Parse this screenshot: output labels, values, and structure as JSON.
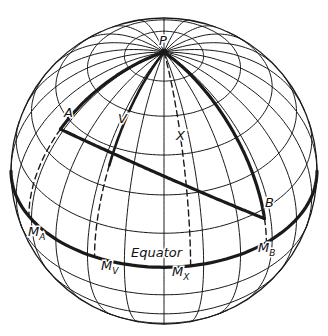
{
  "figure": {
    "type": "orthographic globe diagram",
    "center": [
      164,
      171
    ],
    "radius": 153,
    "view_elevation_deg": 39,
    "meridian_step_deg": 15,
    "parallel_step_deg": 15,
    "colors": {
      "line": "#1a1a1a",
      "background": "#ffffff"
    }
  },
  "labels": {
    "pole": "P",
    "point_a": "A",
    "point_b": "B",
    "point_v": "V",
    "point_x": "X",
    "equator": "Equator",
    "m_a": {
      "base": "M",
      "sub": "A"
    },
    "m_v": {
      "base": "M",
      "sub": "V"
    },
    "m_x": {
      "base": "M",
      "sub": "X"
    },
    "m_b": {
      "base": "M",
      "sub": "B"
    }
  },
  "points": {
    "A": {
      "lon": -62,
      "lat": 40
    },
    "B": {
      "lon": 42,
      "lat": 11
    },
    "V": {
      "lon": -27,
      "lat": 38
    },
    "X": {
      "lon": 10,
      "lat": 30
    }
  },
  "label_positions": {
    "P": [
      159,
      45
    ],
    "A": [
      64,
      117
    ],
    "V": [
      118,
      123
    ],
    "X": [
      176,
      140
    ],
    "B": [
      265,
      207
    ],
    "Equator": [
      131,
      257
    ],
    "M_A": [
      28,
      236
    ],
    "M_V": [
      101,
      270
    ],
    "M_X": [
      172,
      276
    ],
    "M_B": [
      258,
      252
    ]
  }
}
